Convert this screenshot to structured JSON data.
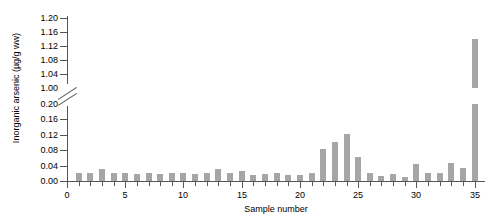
{
  "chart_data": {
    "type": "bar",
    "title": "",
    "subtitle": "",
    "xlabel": "Sample number",
    "ylabel": "Inorganic arsenic (µg/g ww)",
    "grid": false,
    "legend": null,
    "axis_break": {
      "present": true,
      "lower_axis_range": [
        0.0,
        0.2
      ],
      "upper_axis_range": [
        1.0,
        1.2
      ],
      "note": "y-axis broken between 0.20 and 1.00"
    },
    "xlim": [
      0,
      35.8
    ],
    "ylim": [
      0.0,
      1.2
    ],
    "ytick_labels_lower": [
      "0.00",
      "0.04",
      "0.08",
      "0.12",
      "0.16",
      "0.20"
    ],
    "ytick_labels_upper": [
      "1.00",
      "1.04",
      "1.08",
      "1.12",
      "1.16",
      "1.20"
    ],
    "ytick_values_lower": [
      0.0,
      0.04,
      0.08,
      0.12,
      0.16,
      0.2
    ],
    "ytick_values_upper": [
      1.0,
      1.04,
      1.08,
      1.12,
      1.16,
      1.2
    ],
    "xtick_values": [
      0,
      1,
      2,
      3,
      4,
      5,
      6,
      7,
      8,
      9,
      10,
      11,
      12,
      13,
      14,
      15,
      16,
      17,
      18,
      19,
      20,
      21,
      22,
      23,
      24,
      25,
      26,
      27,
      28,
      29,
      30,
      31,
      32,
      33,
      34,
      35
    ],
    "xtick_major_labels": [
      "0",
      "5",
      "10",
      "15",
      "20",
      "25",
      "30",
      "35"
    ],
    "xtick_major_values": [
      0,
      5,
      10,
      15,
      20,
      25,
      30,
      35
    ],
    "bar_color": "#a6a6a6",
    "axis_color": "#555555",
    "categories": [
      1,
      2,
      3,
      4,
      5,
      6,
      7,
      8,
      9,
      10,
      11,
      12,
      13,
      14,
      15,
      16,
      17,
      18,
      19,
      20,
      21,
      22,
      23,
      24,
      25,
      26,
      27,
      28,
      29,
      30,
      31,
      32,
      33,
      34,
      35
    ],
    "values": [
      0.022,
      0.02,
      0.03,
      0.022,
      0.022,
      0.017,
      0.02,
      0.018,
      0.02,
      0.02,
      0.019,
      0.021,
      0.031,
      0.021,
      0.026,
      0.016,
      0.017,
      0.02,
      0.015,
      0.016,
      0.022,
      0.082,
      0.102,
      0.122,
      0.062,
      0.02,
      0.014,
      0.019,
      0.01,
      0.044,
      0.02,
      0.02,
      0.046,
      0.034,
      1.14
    ]
  }
}
